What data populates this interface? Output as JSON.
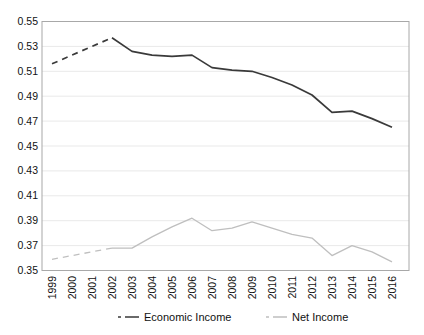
{
  "figure": {
    "background": "#ffffff"
  },
  "chart_data": {
    "type": "line",
    "x": [
      1999,
      2000,
      2001,
      2002,
      2003,
      2004,
      2005,
      2006,
      2007,
      2008,
      2009,
      2010,
      2011,
      2012,
      2013,
      2014,
      2015,
      2016
    ],
    "series": [
      {
        "name": "Economic Income",
        "color": "#3a3a3a",
        "line_width": 1.7,
        "dashed_through_index": 3,
        "values": [
          0.516,
          0.523,
          0.53,
          0.537,
          0.526,
          0.523,
          0.522,
          0.523,
          0.513,
          0.511,
          0.51,
          0.505,
          0.499,
          0.491,
          0.477,
          0.478,
          0.472,
          0.465
        ]
      },
      {
        "name": "Net Income",
        "color": "#bfbfbf",
        "line_width": 1.3,
        "dashed_through_index": 3,
        "values": [
          0.359,
          0.362,
          0.365,
          0.368,
          0.368,
          0.377,
          0.385,
          0.392,
          0.382,
          0.384,
          0.389,
          0.384,
          0.379,
          0.376,
          0.362,
          0.37,
          0.365,
          0.357
        ]
      }
    ],
    "title": "",
    "xlabel": "",
    "ylabel": "",
    "ylim": [
      0.35,
      0.55
    ],
    "ytick_step": 0.02,
    "ytick_decimals": 2,
    "ytick_labels": [
      "0.55",
      "0.53",
      "0.51",
      "0.49",
      "0.47",
      "0.45",
      "0.43",
      "0.41",
      "0.39",
      "0.37",
      "0.35"
    ],
    "grid": true,
    "legend_position": "bottom",
    "colors": {
      "axis_border": "#a8a8a8",
      "gridline": "#e9e9e9",
      "label_text": "#111111"
    }
  }
}
